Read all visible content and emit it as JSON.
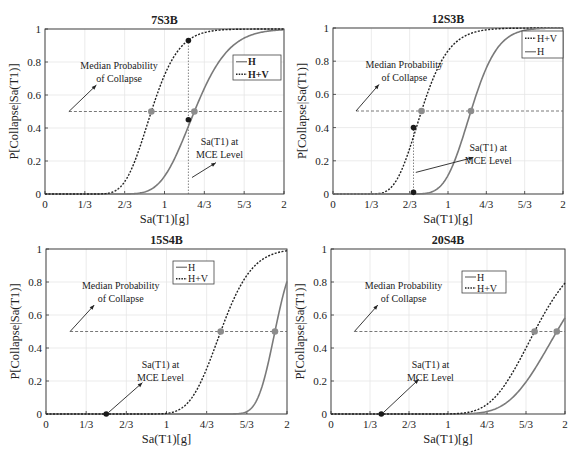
{
  "figure": {
    "colors": {
      "H": "#7a7a7a",
      "HV": "#222222",
      "median_dot": "#8c8c8c",
      "mce_dot": "#1a1a1a",
      "grid": "#e6e6e6",
      "axis": "#333333"
    }
  },
  "chart_data": [
    {
      "type": "line",
      "title": "7S3B",
      "xlabel": "Sa(T1)[g]",
      "ylabel": "P[Collapse|Sa(T1)]",
      "xlim": [
        0,
        2
      ],
      "ylim": [
        0,
        1
      ],
      "xticks": [
        "0",
        "1/3",
        "2/3",
        "1",
        "4/3",
        "5/3",
        "2"
      ],
      "yticks": [
        "0",
        "0.2",
        "0.4",
        "0.6",
        "0.8",
        "1"
      ],
      "grid": true,
      "legend": [
        "H",
        "H+V"
      ],
      "legend_position": "upper right",
      "series": [
        {
          "name": "H",
          "style": "solid",
          "median": 1.25,
          "beta": 0.18
        },
        {
          "name": "H+V",
          "style": "dotted",
          "median": 0.89,
          "beta": 0.2
        }
      ],
      "median_line_y": 0.5,
      "median_points": [
        {
          "x": 0.89,
          "y": 0.5
        },
        {
          "x": 1.25,
          "y": 0.5
        }
      ],
      "mce_x": 1.2,
      "mce_points": [
        {
          "x": 1.2,
          "y": 0.93
        },
        {
          "x": 1.2,
          "y": 0.45
        }
      ],
      "annotations": [
        {
          "text": [
            "Median Probability",
            "of Collapse"
          ],
          "tx": 0.62,
          "ty": 0.76,
          "ax1": 0.2,
          "ay1": 0.5,
          "ax2": 0.43,
          "ay2": 0.66
        },
        {
          "text": [
            "Sa(T1) at",
            "MCE Level"
          ],
          "tx": 1.46,
          "ty": 0.3,
          "ax1": 1.23,
          "ay1": 0.1,
          "ax2": 1.43,
          "ay2": 0.19
        }
      ],
      "box": {
        "x": 0,
        "y": 0,
        "w": 290,
        "h": 228,
        "left": 45,
        "top": 29,
        "right": 284,
        "bottom": 194
      },
      "legend_box": {
        "x": 233,
        "y": 55,
        "w": 48,
        "h": 25
      }
    },
    {
      "type": "line",
      "title": "12S3B",
      "xlabel": "Sa(T1)[g]",
      "ylabel": "P[Collapse|Sa(T1)]",
      "xlim": [
        0,
        2
      ],
      "ylim": [
        0,
        1
      ],
      "xticks": [
        "0",
        "1/3",
        "2/3",
        "1",
        "4/3",
        "5/3",
        "2"
      ],
      "yticks": [
        "0",
        "0.2",
        "0.4",
        "0.6",
        "0.8",
        "1"
      ],
      "grid": true,
      "legend": [
        "H+V",
        "H"
      ],
      "legend_position": "upper right",
      "series": [
        {
          "name": "H+V",
          "style": "dotted",
          "median": 0.77,
          "beta": 0.24
        },
        {
          "name": "H",
          "style": "solid",
          "median": 1.2,
          "beta": 0.15
        }
      ],
      "median_line_y": 0.5,
      "median_points": [
        {
          "x": 0.77,
          "y": 0.5
        },
        {
          "x": 1.2,
          "y": 0.5
        }
      ],
      "mce_x": 0.7,
      "mce_points": [
        {
          "x": 0.7,
          "y": 0.4
        },
        {
          "x": 0.7,
          "y": 0.01
        }
      ],
      "annotations": [
        {
          "text": [
            "Median Probability",
            "of Collapse"
          ],
          "tx": 0.62,
          "ty": 0.76,
          "ax1": 0.2,
          "ay1": 0.5,
          "ax2": 0.4,
          "ay2": 0.66
        },
        {
          "text": [
            "Sa(T1) at",
            "MCE Level"
          ],
          "tx": 1.35,
          "ty": 0.26,
          "ax1": 0.72,
          "ay1": 0.13,
          "ax2": 1.22,
          "ay2": 0.22
        }
      ],
      "box": {
        "x": 290,
        "y": 0,
        "w": 291,
        "h": 228,
        "left": 43,
        "top": 28,
        "right": 273,
        "bottom": 194
      },
      "legend_box": {
        "x": 232,
        "y": 31,
        "w": 41,
        "h": 27
      }
    },
    {
      "type": "line",
      "title": "15S4B",
      "xlabel": "Sa(T1)[g]",
      "ylabel": "P[Collapse|Sa(T1)]",
      "xlim": [
        0,
        2
      ],
      "ylim": [
        0,
        1
      ],
      "xticks": [
        "0",
        "1/3",
        "2/3",
        "1",
        "4/3",
        "5/3",
        "2"
      ],
      "yticks": [
        "0",
        "0.2",
        "0.4",
        "0.6",
        "0.8",
        "1"
      ],
      "grid": true,
      "legend": [
        "H",
        "H+V"
      ],
      "legend_position": "upper center",
      "series": [
        {
          "name": "H",
          "style": "solid",
          "median": 1.9,
          "beta": 0.06
        },
        {
          "name": "H+V",
          "style": "dotted",
          "median": 1.45,
          "beta": 0.14
        }
      ],
      "median_line_y": 0.5,
      "median_points": [
        {
          "x": 1.45,
          "y": 0.5
        },
        {
          "x": 1.9,
          "y": 0.5
        }
      ],
      "mce_x": 0.5,
      "mce_points": [
        {
          "x": 0.5,
          "y": 0.0
        }
      ],
      "annotations": [
        {
          "text": [
            "Median Probability",
            "of Collapse"
          ],
          "tx": 0.62,
          "ty": 0.76,
          "ax1": 0.2,
          "ay1": 0.5,
          "ax2": 0.4,
          "ay2": 0.66
        },
        {
          "text": [
            "Sa(T1) at",
            "MCE Level"
          ],
          "tx": 0.95,
          "ty": 0.28,
          "ax1": 0.52,
          "ay1": 0.01,
          "ax2": 0.8,
          "ay2": 0.19
        }
      ],
      "box": {
        "x": 0,
        "y": 228,
        "w": 290,
        "h": 230,
        "left": 46,
        "top": 21,
        "right": 287,
        "bottom": 186
      },
      "legend_box": {
        "x": 173,
        "y": 33,
        "w": 41,
        "h": 23
      }
    },
    {
      "type": "line",
      "title": "20S4B",
      "xlabel": "Sa(T1)[g]",
      "ylabel": "P[Collapse|Sa(T1)]",
      "xlim": [
        0,
        2
      ],
      "ylim": [
        0,
        1
      ],
      "xticks": [
        "0",
        "1/3",
        "2/3",
        "1",
        "4/3",
        "5/3",
        "2"
      ],
      "yticks": [
        "0",
        "0.2",
        "0.4",
        "0.6",
        "0.8",
        "1"
      ],
      "grid": true,
      "legend": [
        "H",
        "H+V"
      ],
      "legend_position": "upper center",
      "series": [
        {
          "name": "H",
          "style": "solid",
          "median": 1.93,
          "beta": 0.17
        },
        {
          "name": "H+V",
          "style": "dotted",
          "median": 1.74,
          "beta": 0.17
        }
      ],
      "median_line_y": 0.5,
      "median_points": [
        {
          "x": 1.74,
          "y": 0.5
        },
        {
          "x": 1.93,
          "y": 0.5
        }
      ],
      "mce_x": 0.43,
      "mce_points": [
        {
          "x": 0.43,
          "y": 0.0
        }
      ],
      "annotations": [
        {
          "text": [
            "Median Probability",
            "of Collapse"
          ],
          "tx": 0.62,
          "ty": 0.76,
          "ax1": 0.2,
          "ay1": 0.5,
          "ax2": 0.4,
          "ay2": 0.66
        },
        {
          "text": [
            "Sa(T1) at",
            "MCE Level"
          ],
          "tx": 0.85,
          "ty": 0.28,
          "ax1": 0.45,
          "ay1": 0.01,
          "ax2": 0.75,
          "ay2": 0.21
        }
      ],
      "box": {
        "x": 290,
        "y": 228,
        "w": 291,
        "h": 230,
        "left": 41,
        "top": 21,
        "right": 275,
        "bottom": 186
      },
      "legend_box": {
        "x": 172,
        "y": 43,
        "w": 44,
        "h": 22
      }
    }
  ]
}
